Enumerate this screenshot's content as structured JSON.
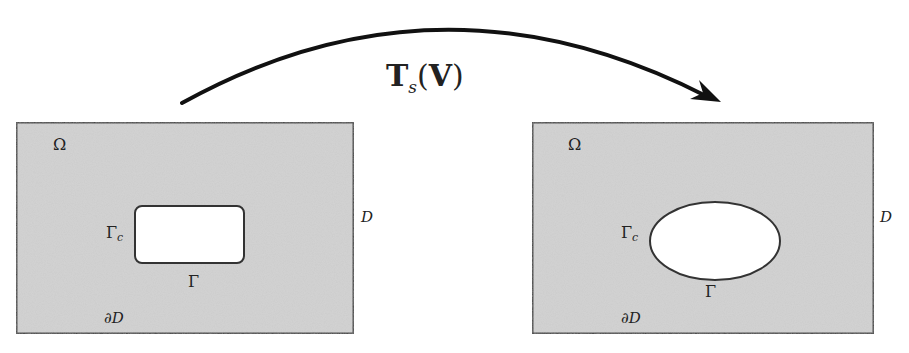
{
  "diagram": {
    "transform_label": {
      "main": "T",
      "subscript": "s",
      "open": "(",
      "arg": "V",
      "close": ")"
    },
    "colors": {
      "domain_fill": "#d4d4d4",
      "border": "#3a3a3a",
      "hole_fill": "#ffffff",
      "arrow": "#111111",
      "text": "#222222"
    },
    "left_panel": {
      "omega": "Ω",
      "gamma_c": {
        "main": "Γ",
        "sub": "c"
      },
      "gamma": "Γ",
      "d_label": "D",
      "boundary_label": "∂D",
      "hole_shape": "rounded-rectangle"
    },
    "right_panel": {
      "omega": "Ω",
      "gamma_c": {
        "main": "Γ",
        "sub": "c"
      },
      "gamma": "Γ",
      "d_label": "D",
      "boundary_label": "∂D",
      "hole_shape": "ellipse"
    }
  }
}
